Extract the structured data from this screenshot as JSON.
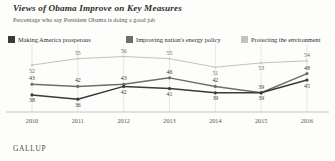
{
  "chart_data": {
    "type": "line",
    "title": "Views of Obama Improve on Key Measures",
    "subtitle": "Percentage who say President Obama is doing a good job",
    "xlabel": "",
    "ylabel": "",
    "x": [
      "2010",
      "2011",
      "2012",
      "2013",
      "2014",
      "2015",
      "2016"
    ],
    "categories": [
      "2010",
      "2011",
      "2012",
      "2013",
      "2014",
      "2015",
      "2016"
    ],
    "ylim": [
      30,
      60
    ],
    "grid": "vertical",
    "legend_position": "top",
    "source": "GALLUP",
    "series": [
      {
        "name": "Making America prosperous",
        "color": "#3a3a38",
        "values": [
          38,
          36,
          42,
          41,
          39,
          39,
          45
        ],
        "label_offsets": [
          "below",
          "below",
          "below",
          "below",
          "below",
          "below",
          "below"
        ]
      },
      {
        "name": "Improving nation's energy policy",
        "color": "#6e6e6a",
        "values": [
          43,
          42,
          43,
          46,
          42,
          39,
          48
        ],
        "label_offsets": [
          "above",
          "above",
          "above",
          "above",
          "above",
          "above",
          "above"
        ]
      },
      {
        "name": "Protecting the environment",
        "color": "#c3c3bd",
        "values": [
          52,
          55,
          56,
          55,
          51,
          53,
          54
        ],
        "label_offsets": [
          "below",
          "above",
          "above",
          "above",
          "below",
          "below",
          "above"
        ]
      }
    ]
  },
  "legend": {
    "items": [
      {
        "label": "Making America prosperous",
        "color": "#3a3a38"
      },
      {
        "label": "Improving nation's energy policy",
        "color": "#6e6e6a"
      },
      {
        "label": "Protecting the environment",
        "color": "#c3c3bd"
      }
    ]
  },
  "footer": {
    "brand": "GALLUP"
  }
}
